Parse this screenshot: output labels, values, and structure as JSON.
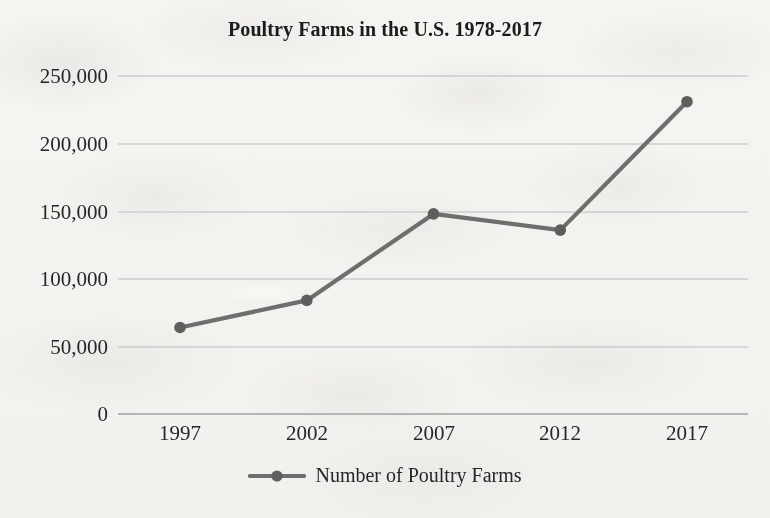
{
  "chart_data": {
    "type": "line",
    "title": "Poultry Farms in the U.S. 1978-2017",
    "xlabel": "",
    "ylabel": "",
    "categories": [
      "1997",
      "2002",
      "2007",
      "2012",
      "2017"
    ],
    "series": [
      {
        "name": "Number of Poultry Farms",
        "values": [
          64000,
          84000,
          148000,
          136000,
          231000
        ],
        "color": "#6e6e6e",
        "marker": "circle"
      }
    ],
    "ylim": [
      0,
      250000
    ],
    "yticks": [
      0,
      50000,
      100000,
      150000,
      200000,
      250000
    ],
    "ytick_labels": [
      "0",
      "50,000",
      "100,000",
      "150,000",
      "200,000",
      "250,000"
    ],
    "xtick_labels": [
      "1997",
      "2002",
      "2007",
      "2012",
      "2017"
    ],
    "grid": "horizontal",
    "legend_position": "bottom",
    "legend_entries": [
      "Number of Poultry Farms"
    ]
  },
  "colors": {
    "line": "#6e6e6e",
    "marker": "#5e5e5e",
    "grid": "#b9b9b9",
    "axis": "#9a9a9a",
    "text": "#262626",
    "background": "#f8f7f5"
  }
}
